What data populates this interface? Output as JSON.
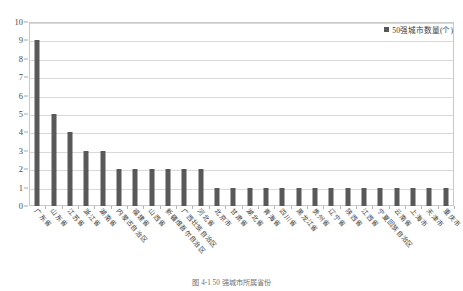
{
  "chart_data": {
    "type": "bar",
    "title": "",
    "xlabel": "",
    "ylabel": "",
    "ylim": [
      0,
      10
    ],
    "yticks": [
      0,
      1,
      2,
      3,
      4,
      5,
      6,
      7,
      8,
      9,
      10
    ],
    "grid": true,
    "legend_position": "top-right",
    "series": [
      {
        "name": "50强城市数量(个)",
        "color": "#595959",
        "values": [
          9,
          5,
          4,
          3,
          3,
          2,
          2,
          2,
          2,
          2,
          2,
          1,
          1,
          1,
          1,
          1,
          1,
          1,
          1,
          1,
          1,
          1,
          1,
          1,
          1,
          1
        ]
      }
    ],
    "categories": [
      "广东省",
      "山东省",
      "江苏省",
      "浙江省",
      "湖南省",
      "内蒙古自治区",
      "福建省",
      "山西省",
      "新疆维吾尔自治区",
      "广西壮族自治区",
      "河北省",
      "北京市",
      "甘肃省",
      "湖北省",
      "青海省",
      "四川省",
      "黑龙江省",
      "贵州省",
      "辽宁省",
      "陕西省",
      "江西省",
      "宁夏回族自治区",
      "云南省",
      "上海市",
      "天津市",
      "重庆市"
    ]
  },
  "legend": {
    "label": "50强城市数量(个)"
  },
  "caption": {
    "text": "图 4-1  50 强城市所属省份"
  }
}
